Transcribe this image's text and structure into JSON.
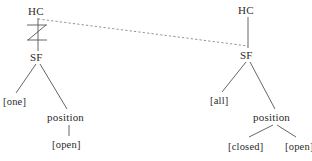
{
  "figure": {
    "type": "syntactic-tree-diagram",
    "stroke_color": "#555555",
    "text_color": "#2b2b2b",
    "background_color": "#ffffff"
  },
  "left_tree": {
    "root": {
      "label": "HC",
      "x": 28,
      "y": 6
    },
    "blocked_link": {
      "symbol": "crossed-link",
      "glyph": "Z-strike",
      "from": "HC",
      "to": "SF"
    },
    "sf": {
      "label": "SF",
      "x": 30,
      "y": 52
    },
    "children": [
      {
        "label": "[one]",
        "x": 3,
        "y": 96
      },
      {
        "label": "position",
        "x": 47,
        "y": 112
      }
    ],
    "position_child": {
      "label": "[open]",
      "x": 52,
      "y": 139
    }
  },
  "right_tree": {
    "root": {
      "label": "HC",
      "x": 238,
      "y": 5
    },
    "sf": {
      "label": "SF",
      "x": 240,
      "y": 50
    },
    "children": [
      {
        "label": "[all]",
        "x": 210,
        "y": 95
      },
      {
        "label": "position",
        "x": 253,
        "y": 112
      }
    ],
    "position_children": [
      {
        "label": "[closed]",
        "x": 228,
        "y": 141
      },
      {
        "label": "[open]",
        "x": 285,
        "y": 141
      }
    ]
  },
  "association_line": {
    "style": "dashed",
    "from": {
      "x": 38,
      "y": 19
    },
    "to": {
      "x": 248,
      "y": 46
    }
  }
}
